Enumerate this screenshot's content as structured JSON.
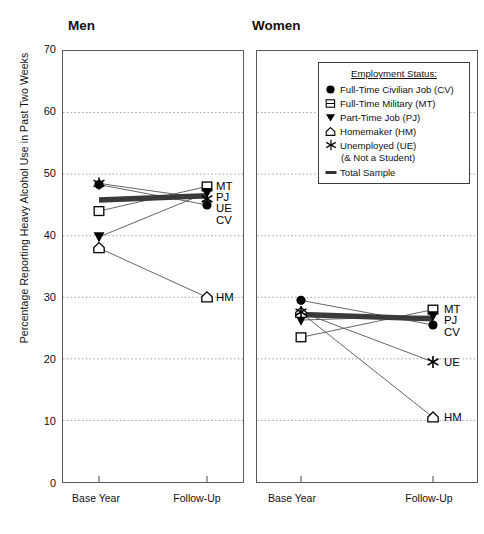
{
  "figure": {
    "ylabel": "Percentage Reporting Heavy Alcohol Use in Past Two Weeks"
  },
  "panels": {
    "men": {
      "title": "Men"
    },
    "women": {
      "title": "Women"
    }
  },
  "legend": {
    "title": "Employment Status:",
    "entries": [
      {
        "marker": "filled-circle-icon",
        "label": "Full-Time Civilian Job (CV)"
      },
      {
        "marker": "open-square-icon",
        "label": "Full-Time Military (MT)"
      },
      {
        "marker": "filled-triangle-down-icon",
        "label": "Part-Time Job (PJ)"
      },
      {
        "marker": "open-pentagon-icon",
        "label": "Homemaker (HM)"
      },
      {
        "marker": "star-icon",
        "label": "Unemployed (UE)"
      },
      {
        "marker": "thick-line-icon",
        "label": "Total Sample"
      }
    ],
    "sub_note": "(& Not a Student)"
  },
  "axis": {
    "y_ticks": [
      "70",
      "60",
      "50",
      "40",
      "30",
      "20",
      "10",
      "0"
    ],
    "x_ticks": [
      "Base Year",
      "Follow-Up"
    ]
  },
  "chart_data": {
    "type": "line",
    "title": "",
    "xlabel": "",
    "ylabel": "Percentage Reporting Heavy Alcohol Use in Past Two Weeks",
    "ylim": [
      0,
      70
    ],
    "ytick_step": 10,
    "grid": true,
    "legend_position": "inside-top-right-women-panel",
    "x": [
      "Base Year",
      "Follow-Up"
    ],
    "panels": [
      {
        "name": "Men",
        "series": [
          {
            "name": "Full-Time Civilian Job (CV)",
            "code": "CV",
            "marker": "filled-circle",
            "values": [
              48.3,
              45.0
            ]
          },
          {
            "name": "Full-Time Military (MT)",
            "code": "MT",
            "marker": "open-square",
            "values": [
              44.0,
              48.0
            ]
          },
          {
            "name": "Part-Time Job (PJ)",
            "code": "PJ",
            "marker": "filled-triangle-down",
            "values": [
              39.8,
              47.0
            ]
          },
          {
            "name": "Homemaker (HM)",
            "code": "HM",
            "marker": "open-pentagon",
            "values": [
              38.0,
              30.0
            ]
          },
          {
            "name": "Unemployed (UE)",
            "code": "UE",
            "marker": "star",
            "values": [
              48.5,
              46.0
            ]
          },
          {
            "name": "Total Sample",
            "code": "TS",
            "marker": "thick-line",
            "values": [
              45.8,
              46.5
            ]
          }
        ],
        "end_labels": [
          "MT",
          "PJ",
          "UE",
          "CV",
          "HM"
        ]
      },
      {
        "name": "Women",
        "series": [
          {
            "name": "Full-Time Civilian Job (CV)",
            "code": "CV",
            "marker": "filled-circle",
            "values": [
              29.5,
              25.5
            ]
          },
          {
            "name": "Full-Time Military (MT)",
            "code": "MT",
            "marker": "open-square",
            "values": [
              23.5,
              28.0
            ]
          },
          {
            "name": "Part-Time Job (PJ)",
            "code": "PJ",
            "marker": "filled-triangle-down",
            "values": [
              26.3,
              27.0
            ]
          },
          {
            "name": "Homemaker (HM)",
            "code": "HM",
            "marker": "open-pentagon",
            "values": [
              27.5,
              10.5
            ]
          },
          {
            "name": "Unemployed (UE)",
            "code": "UE",
            "marker": "star",
            "values": [
              27.6,
              19.5
            ]
          },
          {
            "name": "Total Sample",
            "code": "TS",
            "marker": "thick-line",
            "values": [
              27.2,
              26.5
            ]
          }
        ],
        "end_labels": [
          "MT",
          "PJ",
          "CV",
          "UE",
          "HM"
        ]
      }
    ]
  }
}
